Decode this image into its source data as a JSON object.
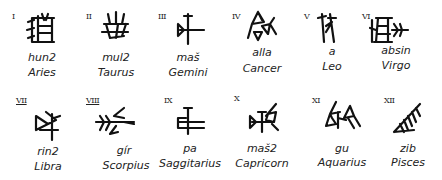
{
  "signs": [
    {
      "numeral": "I",
      "translit": "hun2",
      "name": "Aries",
      "icon": "cuneiform-hun-icon"
    },
    {
      "numeral": "II",
      "translit": "mul2",
      "name": "Taurus",
      "icon": "cuneiform-mul-icon"
    },
    {
      "numeral": "III",
      "translit": "maš",
      "name": "Gemini",
      "icon": "cuneiform-mas-icon"
    },
    {
      "numeral": "IV",
      "translit": "alla",
      "name": "Cancer",
      "icon": "cuneiform-alla-icon"
    },
    {
      "numeral": "V",
      "translit": "a",
      "name": "Leo",
      "icon": "cuneiform-a-icon"
    },
    {
      "numeral": "VI",
      "translit": "absin",
      "name": "Virgo",
      "icon": "cuneiform-absin-icon"
    },
    {
      "numeral": "VII",
      "translit": "rin2",
      "name": "Libra",
      "icon": "cuneiform-rin-icon"
    },
    {
      "numeral": "VIII",
      "translit": "gír",
      "name": "Scorpius",
      "icon": "cuneiform-gir-icon"
    },
    {
      "numeral": "IX",
      "translit": "pa",
      "name": "Saggitarius",
      "icon": "cuneiform-pa-icon"
    },
    {
      "numeral": "X",
      "translit": "maš2",
      "name": "Capricorn",
      "icon": "cuneiform-mas2-icon"
    },
    {
      "numeral": "XI",
      "translit": "gu",
      "name": "Aquarius",
      "icon": "cuneiform-gu-icon"
    },
    {
      "numeral": "XII",
      "translit": "zib",
      "name": "Pisces",
      "icon": "cuneiform-zib-icon"
    }
  ]
}
